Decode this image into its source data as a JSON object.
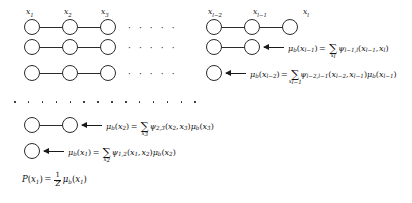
{
  "figure": {
    "background_color": "#ffffff",
    "stroke_color": "#2b2b2b"
  },
  "node_labels": {
    "x1": "x",
    "x1_sub": "1",
    "x2": "x",
    "x2_sub": "2",
    "x3": "x",
    "x3_sub": "3",
    "xlm2": "x",
    "xlm2_sub": "l−2",
    "xlm1": "x",
    "xlm1_sub": "l−1",
    "xl": "x",
    "xl_sub": "l"
  },
  "ellipsis": {
    "inline": "·  ·  ·  ·  ·",
    "band_dot_count": 14
  },
  "rows": [
    {
      "id": "row-1",
      "kind": "graph-only",
      "left_nodes": 3,
      "right_nodes": 3,
      "labeled": true,
      "has_arrow": false,
      "equation": ""
    },
    {
      "id": "row-2",
      "kind": "graph-with-message",
      "left_nodes": 3,
      "right_nodes": 2,
      "labeled": false,
      "has_arrow": true,
      "equation": "μ_b(x_{l-1}) = Σ_{x_l} ψ_{l-1,l}(x_{l-1}, x_l)",
      "message": {
        "mu": "μ",
        "mu_sub": "b",
        "arg_var": "x",
        "arg_sub": "l−1",
        "sum_index": "x",
        "sum_index_sub": "l",
        "psi": "ψ",
        "psi_sub": "l−1,l",
        "psi_args": [
          {
            "var": "x",
            "sub": "l−1"
          },
          {
            "var": "x",
            "sub": "l"
          }
        ],
        "trailing_mu": null
      }
    },
    {
      "id": "row-3",
      "kind": "graph-with-message",
      "left_nodes": 3,
      "right_nodes": 1,
      "labeled": false,
      "has_arrow": true,
      "equation": "μ_b(x_{l-2}) = Σ_{x_{l-1}} ψ_{l-2,l-1}(x_{l-2}, x_{l-1})μ_b(x_{l-1})",
      "message": {
        "mu": "μ",
        "mu_sub": "b",
        "arg_var": "x",
        "arg_sub": "l−2",
        "sum_index": "x",
        "sum_index_sub": "l−1",
        "psi": "ψ",
        "psi_sub": "l−2,l−1",
        "psi_args": [
          {
            "var": "x",
            "sub": "l−2"
          },
          {
            "var": "x",
            "sub": "l−1"
          }
        ],
        "trailing_mu": {
          "mu": "μ",
          "mu_sub": "b",
          "var": "x",
          "sub": "l−1"
        }
      }
    },
    {
      "id": "row-dots",
      "kind": "vertical-ellipsis",
      "equation": ""
    },
    {
      "id": "row-4",
      "kind": "graph-with-message",
      "left_nodes": 2,
      "right_nodes": 0,
      "labeled": false,
      "has_arrow": true,
      "equation": "μ_b(x_2) = Σ_{x_3} ψ_{2,3}(x_2, x_3)μ_b(x_3)",
      "message": {
        "mu": "μ",
        "mu_sub": "b",
        "arg_var": "x",
        "arg_sub": "2",
        "sum_index": "x",
        "sum_index_sub": "3",
        "psi": "ψ",
        "psi_sub": "2,3",
        "psi_args": [
          {
            "var": "x",
            "sub": "2"
          },
          {
            "var": "x",
            "sub": "3"
          }
        ],
        "trailing_mu": {
          "mu": "μ",
          "mu_sub": "b",
          "var": "x",
          "sub": "3"
        }
      }
    },
    {
      "id": "row-5",
      "kind": "graph-with-message",
      "left_nodes": 1,
      "right_nodes": 0,
      "labeled": false,
      "has_arrow": true,
      "equation": "μ_b(x_1) = Σ_{x_2} ψ_{1,2}(x_1, x_2)μ_b(x_2)",
      "message": {
        "mu": "μ",
        "mu_sub": "b",
        "arg_var": "x",
        "arg_sub": "1",
        "sum_index": "x",
        "sum_index_sub": "2",
        "psi": "ψ",
        "psi_sub": "1,2",
        "psi_args": [
          {
            "var": "x",
            "sub": "1"
          },
          {
            "var": "x",
            "sub": "2"
          }
        ],
        "trailing_mu": {
          "mu": "μ",
          "mu_sub": "b",
          "var": "x",
          "sub": "2"
        }
      }
    },
    {
      "id": "row-6",
      "kind": "final-equation",
      "equation": "P(x_1) = (1/Z) μ_b(x_1)",
      "final": {
        "P": "P",
        "arg_var": "x",
        "arg_sub": "1",
        "numerator": "1",
        "denominator": "Z",
        "mu": "μ",
        "mu_sub": "b",
        "mu_var": "x",
        "mu_sub_arg": "1"
      }
    }
  ],
  "symbols": {
    "equals": "=",
    "sigma": "Σ",
    "comma": ",",
    "paren_open": "(",
    "paren_close": ")"
  }
}
